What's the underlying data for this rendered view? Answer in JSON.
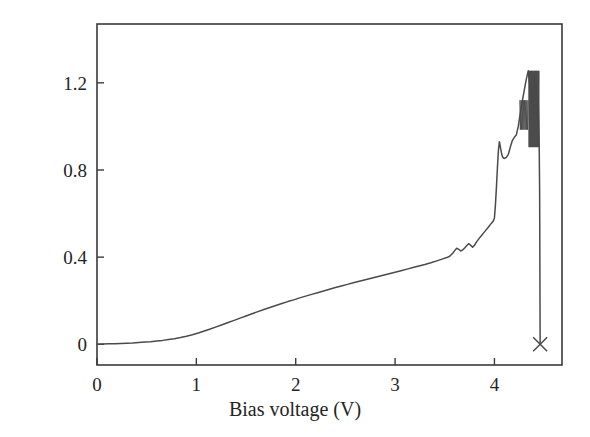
{
  "chart_data": {
    "type": "line",
    "title": "",
    "xlabel": "Bias voltage (V)",
    "ylabel": "Current (mA)",
    "xlim": [
      0,
      4.68
    ],
    "ylim": [
      -0.095,
      1.47
    ],
    "xticks": [
      0,
      1,
      2,
      3,
      4
    ],
    "xticklabels": [
      "0",
      "1",
      "2",
      "3",
      "4"
    ],
    "yticks": [
      0,
      0.4,
      0.8,
      1.2
    ],
    "yticklabels": [
      "0",
      "0.4",
      "0.8",
      "1.2"
    ],
    "grid": false,
    "legend": null,
    "line_color": "#4a4a4a",
    "frame_color": "#3a3a3a",
    "annotations": [
      {
        "name": "breakdown-marker",
        "symbol": "×",
        "x": 4.46,
        "y": 0.0
      }
    ],
    "series": [
      {
        "name": "I-V sweep",
        "x": [
          0.0,
          0.06,
          0.12,
          0.18,
          0.24,
          0.3,
          0.36,
          0.42,
          0.48,
          0.54,
          0.6,
          0.66,
          0.72,
          0.78,
          0.84,
          0.9,
          0.96,
          1.02,
          1.08,
          1.14,
          1.2,
          1.26,
          1.32,
          1.38,
          1.44,
          1.5,
          1.56,
          1.62,
          1.68,
          1.74,
          1.8,
          1.86,
          1.92,
          1.98,
          2.04,
          2.1,
          2.16,
          2.22,
          2.28,
          2.34,
          2.4,
          2.46,
          2.52,
          2.58,
          2.64,
          2.7,
          2.76,
          2.82,
          2.88,
          2.94,
          3.0,
          3.06,
          3.12,
          3.18,
          3.24,
          3.3,
          3.36,
          3.42,
          3.48,
          3.52,
          3.55,
          3.58,
          3.6,
          3.62,
          3.64,
          3.66,
          3.68,
          3.7,
          3.72,
          3.74,
          3.76,
          3.78,
          3.8,
          3.82,
          3.86,
          3.9,
          3.94,
          3.97,
          3.99,
          4.0,
          4.01,
          4.02,
          4.03,
          4.04,
          4.05,
          4.06,
          4.07,
          4.08,
          4.09,
          4.1,
          4.12,
          4.14,
          4.16,
          4.18,
          4.2,
          4.22,
          4.24,
          4.26,
          4.28,
          4.3,
          4.32,
          4.34,
          4.36,
          4.37,
          4.38,
          4.39,
          4.4,
          4.41,
          4.42,
          4.43,
          4.44,
          4.45,
          4.455,
          4.46
        ],
        "y": [
          0.0,
          0.001,
          0.002,
          0.003,
          0.004,
          0.005,
          0.006,
          0.008,
          0.01,
          0.012,
          0.015,
          0.018,
          0.022,
          0.026,
          0.031,
          0.037,
          0.044,
          0.052,
          0.061,
          0.07,
          0.08,
          0.09,
          0.1,
          0.11,
          0.12,
          0.13,
          0.14,
          0.15,
          0.16,
          0.169,
          0.178,
          0.187,
          0.196,
          0.204,
          0.213,
          0.221,
          0.229,
          0.237,
          0.245,
          0.253,
          0.261,
          0.268,
          0.275,
          0.282,
          0.289,
          0.296,
          0.303,
          0.31,
          0.317,
          0.324,
          0.331,
          0.338,
          0.345,
          0.352,
          0.359,
          0.366,
          0.374,
          0.383,
          0.392,
          0.398,
          0.404,
          0.418,
          0.43,
          0.441,
          0.436,
          0.428,
          0.433,
          0.442,
          0.452,
          0.462,
          0.455,
          0.446,
          0.455,
          0.47,
          0.494,
          0.516,
          0.538,
          0.556,
          0.567,
          0.58,
          0.64,
          0.72,
          0.81,
          0.89,
          0.93,
          0.905,
          0.88,
          0.862,
          0.855,
          0.853,
          0.858,
          0.872,
          0.905,
          0.935,
          0.95,
          0.96,
          1.0,
          1.06,
          1.115,
          1.165,
          1.215,
          1.255,
          1.18,
          1.1,
          1.175,
          1.06,
          1.23,
          1.09,
          1.2,
          1.02,
          1.14,
          0.93,
          0.7,
          0.0
        ]
      }
    ]
  },
  "axes": {
    "xticks": [
      {
        "label": "0",
        "value": 0
      },
      {
        "label": "1",
        "value": 1
      },
      {
        "label": "2",
        "value": 2
      },
      {
        "label": "3",
        "value": 3
      },
      {
        "label": "4",
        "value": 4
      }
    ],
    "yticks": [
      {
        "label": "0",
        "value": 0
      },
      {
        "label": "0.4",
        "value": 0.4
      },
      {
        "label": "0.8",
        "value": 0.8
      },
      {
        "label": "1.2",
        "value": 1.2
      }
    ]
  },
  "labels": {
    "x_title": "Bias voltage (V)",
    "y_title": "Current (mA)",
    "marker_symbol": "×"
  }
}
